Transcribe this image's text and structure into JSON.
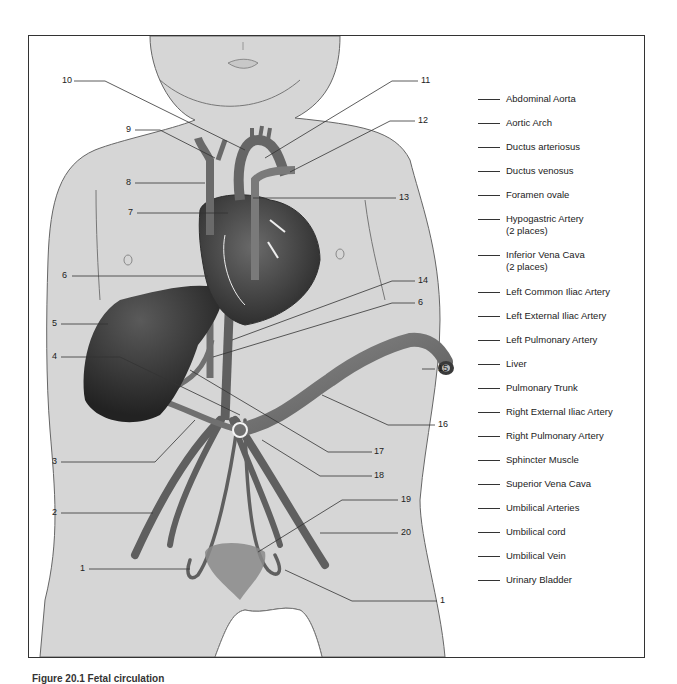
{
  "figure": {
    "caption": "Figure 20.1  Fetal circulation",
    "skin_color": "#d6d6d6",
    "organ_dark": "#3a3a3a",
    "vessel_color": "#6e6e6e"
  },
  "callouts": [
    {
      "id": "c10",
      "label": "10",
      "x": 62,
      "y": 78
    },
    {
      "id": "c11",
      "label": "11",
      "x": 421,
      "y": 78
    },
    {
      "id": "c9",
      "label": "9",
      "x": 126,
      "y": 126
    },
    {
      "id": "c12",
      "label": "12",
      "x": 418,
      "y": 118
    },
    {
      "id": "c8",
      "label": "8",
      "x": 126,
      "y": 180
    },
    {
      "id": "c13",
      "label": "13",
      "x": 399,
      "y": 195
    },
    {
      "id": "c7",
      "label": "7",
      "x": 128,
      "y": 210
    },
    {
      "id": "c6a",
      "label": "6",
      "x": 62,
      "y": 273
    },
    {
      "id": "c14",
      "label": "14",
      "x": 418,
      "y": 278
    },
    {
      "id": "c6b",
      "label": "6",
      "x": 418,
      "y": 300
    },
    {
      "id": "c5",
      "label": "5",
      "x": 52,
      "y": 321
    },
    {
      "id": "c4",
      "label": "4",
      "x": 52,
      "y": 354
    },
    {
      "id": "c15",
      "label": "15",
      "x": 438,
      "y": 366
    },
    {
      "id": "c16",
      "label": "16",
      "x": 438,
      "y": 422
    },
    {
      "id": "c17",
      "label": "17",
      "x": 374,
      "y": 449
    },
    {
      "id": "c3",
      "label": "3",
      "x": 52,
      "y": 459
    },
    {
      "id": "c18",
      "label": "18",
      "x": 374,
      "y": 473
    },
    {
      "id": "c19",
      "label": "19",
      "x": 401,
      "y": 497
    },
    {
      "id": "c2",
      "label": "2",
      "x": 52,
      "y": 510
    },
    {
      "id": "c20",
      "label": "20",
      "x": 401,
      "y": 530
    },
    {
      "id": "c1a",
      "label": "1",
      "x": 80,
      "y": 566
    },
    {
      "id": "c1b",
      "label": "1",
      "x": 440,
      "y": 598
    }
  ],
  "legend": {
    "items": [
      {
        "label": "Abdominal Aorta"
      },
      {
        "label": "Aortic Arch"
      },
      {
        "label": "Ductus arteriosus"
      },
      {
        "label": "Ductus venosus"
      },
      {
        "label": "Foramen ovale"
      },
      {
        "label": "Hypogastric Artery",
        "sub": "(2 places)"
      },
      {
        "label": "Inferior Vena Cava",
        "sub": "(2 places)"
      },
      {
        "label": "Left Common Iliac Artery"
      },
      {
        "label": "Left External Iliac Artery"
      },
      {
        "label": "Left Pulmonary Artery"
      },
      {
        "label": "Liver"
      },
      {
        "label": "Pulmonary Trunk"
      },
      {
        "label": "Right External Iliac Artery"
      },
      {
        "label": "Right Pulmonary Artery"
      },
      {
        "label": "Sphincter Muscle"
      },
      {
        "label": "Superior Vena Cava"
      },
      {
        "label": "Umbilical Arteries"
      },
      {
        "label": "Umbilical cord"
      },
      {
        "label": "Umbilical Vein"
      },
      {
        "label": "Urinary Bladder"
      }
    ]
  }
}
